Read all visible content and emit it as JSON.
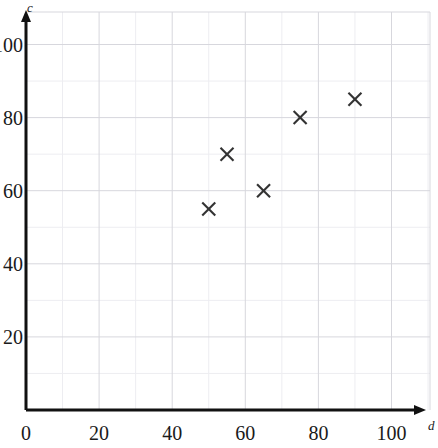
{
  "chart_data": {
    "type": "scatter",
    "title": "",
    "xlabel": "d",
    "ylabel": "c",
    "xlim": [
      0,
      112
    ],
    "ylim": [
      0,
      112
    ],
    "xticks": [
      0,
      20,
      40,
      60,
      80,
      100
    ],
    "yticks": [
      20,
      40,
      60,
      80,
      100
    ],
    "xtick_labels": [
      "0",
      "20",
      "40",
      "60",
      "80",
      "100"
    ],
    "ytick_labels": [
      "20",
      "40",
      "60",
      "80",
      "100"
    ],
    "grid": true,
    "grid_major_step": 20,
    "grid_minor_step": 10,
    "legend": "none",
    "marker": "x",
    "marker_color": "#333333",
    "points": [
      {
        "x": 50,
        "y": 55
      },
      {
        "x": 55,
        "y": 70
      },
      {
        "x": 65,
        "y": 60
      },
      {
        "x": 75,
        "y": 80
      },
      {
        "x": 90,
        "y": 85
      }
    ],
    "series": [
      {
        "name": "data",
        "x": [
          50,
          55,
          65,
          75,
          90
        ],
        "y": [
          55,
          70,
          60,
          80,
          85
        ]
      }
    ]
  },
  "axes": {
    "x_axis_name": "d",
    "y_axis_name": "c",
    "origin_label": "0"
  },
  "colors": {
    "axis": "#111111",
    "grid_major": "#d7d7dd",
    "grid_minor": "#ededf1",
    "marker": "#333333",
    "text": "#1a1a1a",
    "background": "#ffffff"
  }
}
